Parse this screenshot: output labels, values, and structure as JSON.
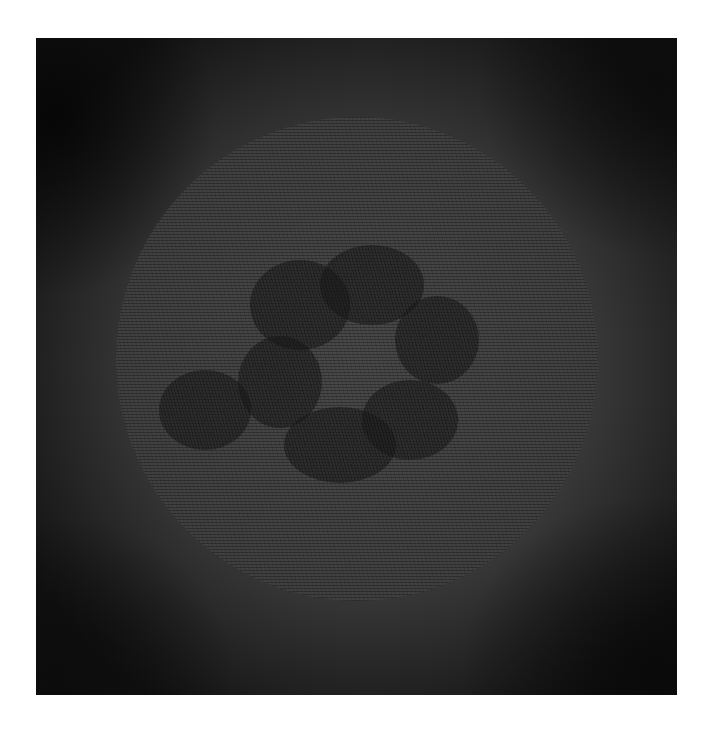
{
  "image": {
    "description": "Grayscale textured artwork: a hatched/scribbled circular disc containing seven dark overlapping oval blobs, set inside a dark vignetted square on a white background",
    "colors": {
      "page_background": "#ffffff",
      "frame_base": "#3a3a3a",
      "frame_corner_dark": "#121212",
      "disc": "#3c3c3c",
      "blob": "#1c1c1c"
    },
    "frame": {
      "x": 36,
      "y": 38,
      "width": 641,
      "height": 657
    },
    "disc": {
      "center_x": 357,
      "center_y": 358,
      "radius": 241
    },
    "blobs": [
      {
        "label": "top",
        "cx": 372,
        "cy": 285,
        "rx": 52,
        "ry": 40
      },
      {
        "label": "upper-left",
        "cx": 300,
        "cy": 305,
        "rx": 50,
        "ry": 45
      },
      {
        "label": "right",
        "cx": 437,
        "cy": 340,
        "rx": 42,
        "ry": 44
      },
      {
        "label": "center-left",
        "cx": 280,
        "cy": 382,
        "rx": 42,
        "ry": 46
      },
      {
        "label": "far-left",
        "cx": 205,
        "cy": 410,
        "rx": 46,
        "ry": 40
      },
      {
        "label": "lower-right",
        "cx": 410,
        "cy": 420,
        "rx": 48,
        "ry": 40
      },
      {
        "label": "bottom",
        "cx": 340,
        "cy": 445,
        "rx": 56,
        "ry": 38
      }
    ]
  }
}
